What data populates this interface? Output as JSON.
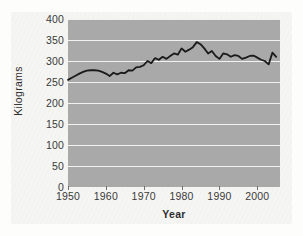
{
  "figure": {
    "background_color": "#f5f5f3",
    "plot_background_color": "#a9a9a9",
    "gridline_color": "#f2f2f0",
    "line_color": "#1a1a1a"
  },
  "chart_data": {
    "type": "line",
    "title": "",
    "xlabel": "Year",
    "ylabel": "Kilograms",
    "xlim": [
      1950,
      2006
    ],
    "ylim": [
      0,
      400
    ],
    "grid": "horizontal",
    "legend": "none",
    "ytick_labels": [
      "400",
      "350",
      "300",
      "250",
      "200",
      "150",
      "100",
      "50",
      "0"
    ],
    "yticks": [
      400,
      350,
      300,
      250,
      200,
      150,
      100,
      50,
      0
    ],
    "xtick_labels": [
      "1950",
      "1960",
      "1970",
      "1980",
      "1990",
      "2000"
    ],
    "xticks": [
      1950,
      1960,
      1970,
      1980,
      1990,
      2000
    ],
    "series": [
      {
        "name": "Kilograms",
        "x": [
          1950,
          1951,
          1952,
          1953,
          1954,
          1955,
          1956,
          1957,
          1958,
          1959,
          1960,
          1961,
          1962,
          1963,
          1964,
          1965,
          1966,
          1967,
          1968,
          1969,
          1970,
          1971,
          1972,
          1973,
          1974,
          1975,
          1976,
          1977,
          1978,
          1979,
          1980,
          1981,
          1982,
          1983,
          1984,
          1985,
          1986,
          1987,
          1988,
          1989,
          1990,
          1991,
          1992,
          1993,
          1994,
          1995,
          1996,
          1997,
          1998,
          1999,
          2000,
          2001,
          2002,
          2003,
          2004,
          2005
        ],
        "values": [
          255,
          260,
          265,
          270,
          274,
          277,
          278,
          278,
          277,
          274,
          270,
          264,
          272,
          268,
          272,
          271,
          278,
          277,
          285,
          286,
          290,
          300,
          295,
          307,
          303,
          310,
          305,
          312,
          318,
          315,
          330,
          322,
          327,
          333,
          345,
          340,
          330,
          318,
          324,
          312,
          305,
          318,
          316,
          310,
          314,
          312,
          305,
          308,
          312,
          313,
          308,
          303,
          300,
          292,
          320,
          310
        ]
      }
    ]
  }
}
